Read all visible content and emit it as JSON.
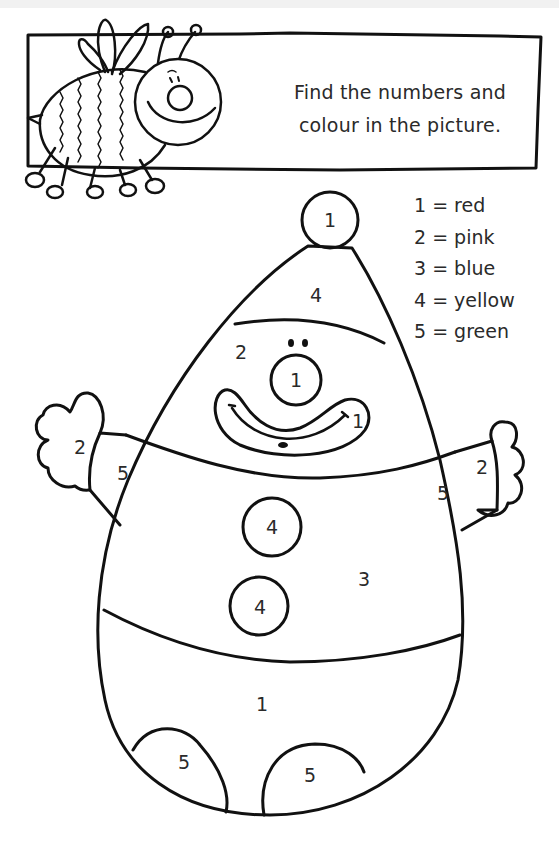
{
  "worksheet": {
    "instructions": {
      "line1": "Find the numbers and",
      "line2": "colour in the picture."
    },
    "colour_key": [
      {
        "number": "1",
        "colour": "red",
        "label": "1 = red"
      },
      {
        "number": "2",
        "colour": "pink",
        "label": "2 = pink"
      },
      {
        "number": "3",
        "colour": "blue",
        "label": "3 = blue"
      },
      {
        "number": "4",
        "colour": "yellow",
        "label": "4 = yellow"
      },
      {
        "number": "5",
        "colour": "green",
        "label": "5 = green"
      }
    ],
    "regions": {
      "hat_pompom": "1",
      "hat": "4",
      "face": "2",
      "nose": "1",
      "mouth": "1",
      "left_glove": "2",
      "left_cuff": "5",
      "right_cuff": "5",
      "right_glove": "2",
      "button_top": "4",
      "button_bottom": "4",
      "jacket": "3",
      "trousers": "1",
      "left_shoe": "5",
      "right_shoe": "5"
    },
    "decoration": "bee-illustration",
    "line_color": "#111111",
    "paper_color": "#ffffff"
  }
}
